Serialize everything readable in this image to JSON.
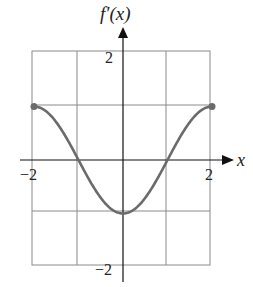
{
  "chart_data": {
    "type": "line",
    "title": "",
    "ylabel": "f′(x)",
    "xlabel": "x",
    "xlim": [
      -2,
      2
    ],
    "ylim": [
      -2,
      2
    ],
    "grid": true,
    "x_ticks_labeled": [
      "−2",
      "2"
    ],
    "y_ticks_labeled": [
      "2",
      "−2"
    ],
    "series": [
      {
        "name": "f′(x)",
        "function": "-cos(pi*x/2)",
        "x": [
          -2,
          -1.5,
          -1,
          -0.5,
          0,
          0.5,
          1,
          1.5,
          2
        ],
        "y": [
          1,
          0.71,
          0,
          -0.71,
          -1,
          -0.71,
          0,
          0.71,
          1
        ],
        "endpoints": [
          {
            "x": -2,
            "y": 1
          },
          {
            "x": 2,
            "y": 1
          }
        ]
      }
    ],
    "colors": {
      "curve": "#6b6b6b",
      "grid": "#8a8a8a",
      "axis": "#111111"
    }
  },
  "labels": {
    "y_axis": "f′(x)",
    "x_axis": "x",
    "x_min": "−2",
    "x_max": "2",
    "y_max": "2",
    "y_min": "−2"
  }
}
